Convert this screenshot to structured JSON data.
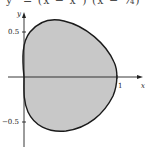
{
  "header": {
    "equation_fragment": "y² = (x − x²) (x − ¾)"
  },
  "axes": {
    "x_label": "x",
    "y_label": "y",
    "ticks": {
      "y_pos": "0.5",
      "y_neg": "−0.5",
      "x_one": "1"
    }
  },
  "figure": {
    "curve_fill": "#c8c8c8",
    "curve_stroke": "#1a1a1a"
  }
}
